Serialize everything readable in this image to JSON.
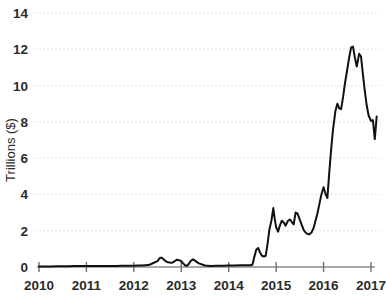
{
  "chart_data": {
    "type": "line",
    "title": "",
    "subtitle": "",
    "xlabel": "",
    "ylabel": "Trillions ($)",
    "xlim": [
      2010,
      2017.12
    ],
    "ylim": [
      0,
      14
    ],
    "grid": true,
    "legend": false,
    "legend_position": "none",
    "yticks": [
      0,
      2,
      4,
      6,
      8,
      10,
      12,
      14
    ],
    "ytick_labels": [
      "0",
      "2",
      "4",
      "6",
      "8",
      "10",
      "12",
      "14"
    ],
    "xticks": [
      2010,
      2011,
      2012,
      2013,
      2014,
      2015,
      2016,
      2017
    ],
    "xtick_labels": [
      "2010",
      "2011",
      "2012",
      "2013",
      "2014",
      "2015",
      "2016",
      "2017"
    ],
    "series": [
      {
        "name": "Value",
        "color": "#111111",
        "x": [
          2010.0,
          2010.12,
          2010.25,
          2010.37,
          2010.5,
          2010.62,
          2010.75,
          2010.87,
          2011.0,
          2011.12,
          2011.25,
          2011.37,
          2011.5,
          2011.62,
          2011.75,
          2011.87,
          2012.0,
          2012.08,
          2012.16,
          2012.25,
          2012.33,
          2012.41,
          2012.5,
          2012.54,
          2012.58,
          2012.62,
          2012.66,
          2012.7,
          2012.75,
          2012.79,
          2012.83,
          2012.87,
          2012.91,
          2012.95,
          2013.0,
          2013.04,
          2013.08,
          2013.12,
          2013.16,
          2013.2,
          2013.25,
          2013.37,
          2013.5,
          2013.62,
          2013.75,
          2013.87,
          2014.0,
          2014.12,
          2014.25,
          2014.37,
          2014.45,
          2014.5,
          2014.54,
          2014.58,
          2014.62,
          2014.66,
          2014.7,
          2014.74,
          2014.78,
          2014.82,
          2014.86,
          2014.9,
          2014.94,
          2014.97,
          2015.0,
          2015.04,
          2015.08,
          2015.12,
          2015.16,
          2015.2,
          2015.25,
          2015.29,
          2015.33,
          2015.37,
          2015.41,
          2015.45,
          2015.5,
          2015.54,
          2015.58,
          2015.62,
          2015.66,
          2015.7,
          2015.75,
          2015.79,
          2015.83,
          2015.87,
          2015.91,
          2015.95,
          2016.0,
          2016.04,
          2016.08,
          2016.12,
          2016.16,
          2016.2,
          2016.25,
          2016.29,
          2016.33,
          2016.37,
          2016.41,
          2016.45,
          2016.5,
          2016.54,
          2016.58,
          2016.62,
          2016.66,
          2016.7,
          2016.75,
          2016.79,
          2016.83,
          2016.87,
          2016.91,
          2016.95,
          2017.0,
          2017.04,
          2017.08,
          2017.12
        ],
        "y": [
          0.03,
          0.03,
          0.03,
          0.04,
          0.04,
          0.04,
          0.05,
          0.05,
          0.05,
          0.05,
          0.06,
          0.06,
          0.06,
          0.06,
          0.07,
          0.07,
          0.07,
          0.08,
          0.08,
          0.1,
          0.12,
          0.22,
          0.32,
          0.48,
          0.52,
          0.44,
          0.34,
          0.28,
          0.25,
          0.24,
          0.26,
          0.34,
          0.4,
          0.38,
          0.32,
          0.2,
          0.1,
          0.06,
          0.18,
          0.34,
          0.42,
          0.2,
          0.08,
          0.06,
          0.07,
          0.07,
          0.08,
          0.08,
          0.09,
          0.1,
          0.1,
          0.12,
          0.55,
          0.95,
          1.05,
          0.8,
          0.62,
          0.58,
          0.62,
          1.3,
          2.1,
          2.55,
          3.25,
          2.65,
          2.2,
          1.95,
          2.3,
          2.55,
          2.45,
          2.28,
          2.55,
          2.62,
          2.48,
          2.35,
          3.0,
          2.95,
          2.6,
          2.32,
          2.05,
          1.9,
          1.82,
          1.8,
          1.92,
          2.15,
          2.55,
          2.95,
          3.45,
          3.95,
          4.4,
          4.05,
          3.8,
          5.2,
          6.5,
          7.6,
          8.6,
          9.0,
          8.75,
          8.7,
          9.35,
          10.1,
          10.9,
          11.55,
          12.1,
          12.15,
          11.55,
          11.05,
          11.75,
          11.6,
          10.6,
          9.7,
          8.9,
          8.35,
          8.05,
          8.1,
          7.05,
          8.3
        ]
      }
    ]
  }
}
